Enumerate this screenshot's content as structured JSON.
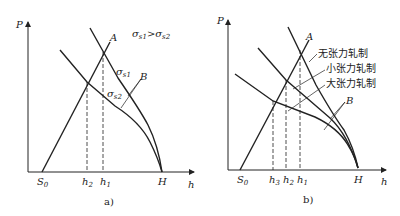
{
  "panel_a": {
    "axis_y": "P",
    "axis_x": "h",
    "s0": "S",
    "s0_sub": "0",
    "h2": "h",
    "h2_sub": "2",
    "h1": "h",
    "h1_sub": "1",
    "H": "H",
    "A": "A",
    "B": "B",
    "sigma1": "σ",
    "sigma1_sub": "s1",
    "sigma2": "σ",
    "sigma2_sub": "s2",
    "relation": "σs1 > σs2",
    "caption": "a)"
  },
  "panel_b": {
    "axis_y": "P",
    "axis_x": "h",
    "s0": "S",
    "s0_sub": "0",
    "h3": "h",
    "h3_sub": "3",
    "h2": "h",
    "h2_sub": "2",
    "h1": "h",
    "h1_sub": "1",
    "H": "H",
    "A": "A",
    "B": "B",
    "label_no_tension": "无张力轧制",
    "label_small_tension": "小张力轧制",
    "label_large_tension": "大张力轧制",
    "caption": "b)"
  },
  "colors": {
    "line": "#222222",
    "background": "#ffffff"
  }
}
